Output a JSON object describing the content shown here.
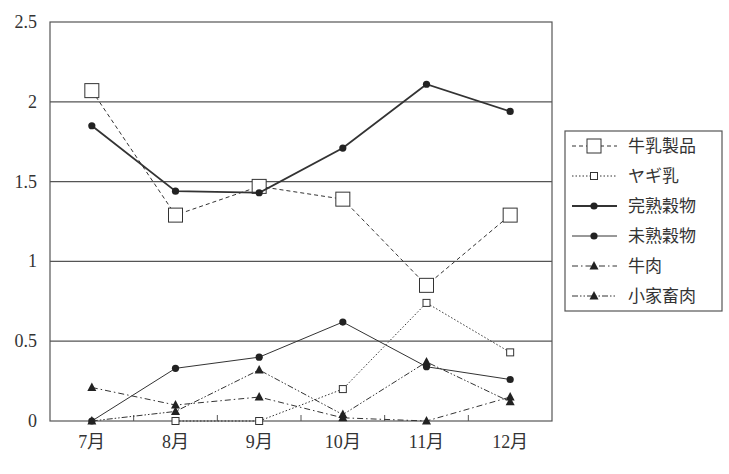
{
  "chart_data": {
    "type": "line",
    "title": "",
    "xlabel": "",
    "ylabel": "",
    "categories": [
      "7月",
      "8月",
      "9月",
      "10月",
      "11月",
      "12月"
    ],
    "ylim": [
      0,
      2.5
    ],
    "yticks": [
      "0",
      "0.5",
      "1",
      "1.5",
      "2",
      "2.5"
    ],
    "ytick_values": [
      0,
      0.5,
      1,
      1.5,
      2,
      2.5
    ],
    "grid": true,
    "legend_position": "right",
    "series": [
      {
        "name": "牛乳製品",
        "values": [
          2.07,
          1.29,
          1.47,
          1.39,
          0.85,
          1.29
        ],
        "marker": "square-large",
        "line": "dashed",
        "width": 1
      },
      {
        "name": "ヤギ乳",
        "values": [
          null,
          0.0,
          0.0,
          0.2,
          0.74,
          0.43
        ],
        "marker": "square-small",
        "line": "dotted",
        "width": 1
      },
      {
        "name": "完熟穀物",
        "values": [
          1.85,
          1.44,
          1.43,
          1.71,
          2.11,
          1.94
        ],
        "marker": "circle",
        "line": "solid",
        "width": 1.8
      },
      {
        "name": "未熟穀物",
        "values": [
          0.0,
          0.33,
          0.4,
          0.62,
          0.34,
          0.26
        ],
        "marker": "circle",
        "line": "solid",
        "width": 1
      },
      {
        "name": "牛肉",
        "values": [
          0.21,
          0.1,
          0.15,
          0.02,
          0.0,
          0.15
        ],
        "marker": "triangle",
        "line": "dashdot",
        "width": 1
      },
      {
        "name": "小家畜肉",
        "values": [
          0.0,
          0.06,
          0.32,
          0.04,
          0.37,
          0.12
        ],
        "marker": "triangle",
        "line": "dashdotdot",
        "width": 1
      }
    ]
  },
  "colors": {
    "line": "#333333",
    "grid": "#555555",
    "marker_fill": "#222222",
    "background": "#ffffff"
  }
}
